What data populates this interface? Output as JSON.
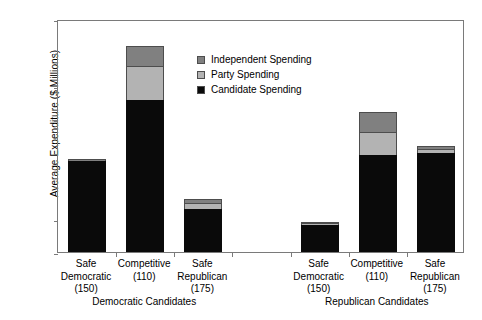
{
  "chart_data": {
    "type": "bar",
    "stacked": true,
    "title": "",
    "xlabel": "",
    "ylabel": "Average Expenditure ($ Millions)",
    "ylim": [
      0,
      3.5
    ],
    "ytick_values": [
      0,
      0.5,
      1,
      1.5,
      2,
      2.5,
      3,
      3.5
    ],
    "ytick_labels": [
      "0",
      "0.5",
      "1",
      "1.5",
      "2",
      "2.5",
      "3",
      "3.5"
    ],
    "grid": false,
    "legend_position": "inside-top-center",
    "series": [
      {
        "name": "Candidate Spending",
        "color": "#0a0a0a",
        "values": [
          1.36,
          2.29,
          0.65,
          0.41,
          1.45,
          1.49
        ]
      },
      {
        "name": "Party Spending",
        "color": "#b3b3b3",
        "values": [
          0.0,
          0.5,
          0.09,
          0.005,
          0.35,
          0.05
        ]
      },
      {
        "name": "Independent Spending",
        "color": "#808080",
        "values": [
          0.04,
          0.31,
          0.06,
          0.005,
          0.3,
          0.06
        ]
      }
    ],
    "groups": [
      {
        "label": "Democratic Candidates",
        "categories": [
          {
            "line1": "Safe",
            "line2": "Democratic",
            "line3": "(150)",
            "n": 150,
            "total": 1.4
          },
          {
            "line1": "Competitive",
            "line2": "(110)",
            "line3": "",
            "n": 110,
            "total": 3.1
          },
          {
            "line1": "Safe",
            "line2": "Republican",
            "line3": "(175)",
            "n": 175,
            "total": 0.8
          }
        ]
      },
      {
        "label": "Republican Candidates",
        "categories": [
          {
            "line1": "Safe",
            "line2": "Democratic",
            "line3": "(150)",
            "n": 150,
            "total": 0.42
          },
          {
            "line1": "Competitive",
            "line2": "(110)",
            "line3": "",
            "n": 110,
            "total": 2.1
          },
          {
            "line1": "Safe",
            "line2": "Republican",
            "line3": "(175)",
            "n": 175,
            "total": 1.6
          }
        ]
      }
    ]
  },
  "legend": {
    "items": [
      {
        "label": "Independent Spending",
        "color": "#808080"
      },
      {
        "label": "Party Spending",
        "color": "#b3b3b3"
      },
      {
        "label": "Candidate Spending",
        "color": "#0a0a0a"
      }
    ]
  }
}
